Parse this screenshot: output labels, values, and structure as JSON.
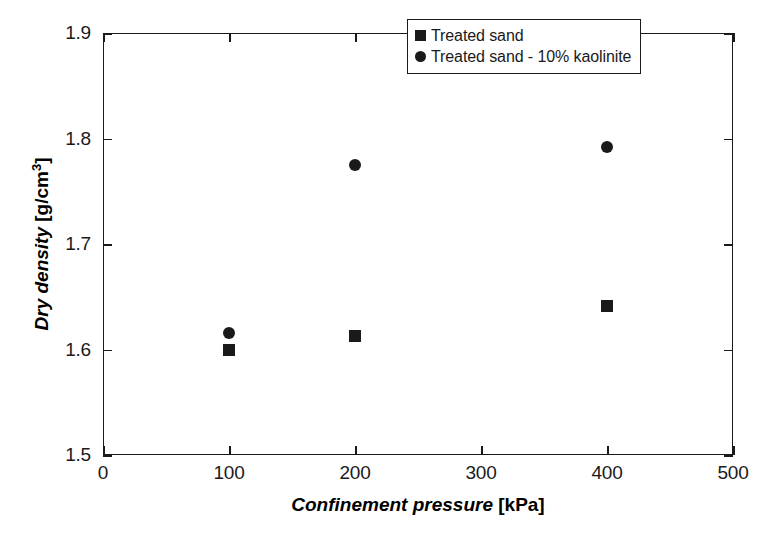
{
  "chart_data": {
    "type": "scatter",
    "title": "",
    "xlabel_name": "Confinement pressure",
    "xlabel_units": "[kPa]",
    "ylabel_name": "Dry density",
    "ylabel_units_pre": "[g/cm",
    "ylabel_units_sup": "3",
    "ylabel_units_post": "]",
    "xlim": [
      0,
      500
    ],
    "ylim": [
      1.5,
      1.9
    ],
    "xticks": [
      0,
      100,
      200,
      300,
      400,
      500
    ],
    "xtick_labels": [
      "0",
      "100",
      "200",
      "300",
      "400",
      "500"
    ],
    "yticks": [
      1.5,
      1.6,
      1.7,
      1.8,
      1.9
    ],
    "ytick_labels": [
      "1.5",
      "1.6",
      "1.7",
      "1.8",
      "1.9"
    ],
    "grid": false,
    "legend_position": "top-right-inside",
    "marker_color": "#1a1a1a",
    "series": [
      {
        "name": "Treated sand",
        "marker": "square",
        "x": [
          100,
          200,
          400
        ],
        "values": [
          1.6,
          1.613,
          1.641
        ]
      },
      {
        "name": "Treated sand - 10% kaolinite",
        "marker": "circle",
        "x": [
          100,
          200,
          400
        ],
        "values": [
          1.616,
          1.775,
          1.792
        ]
      }
    ]
  },
  "legend": {
    "items": [
      {
        "label": "Treated sand",
        "marker": "square"
      },
      {
        "label": "Treated sand - 10% kaolinite",
        "marker": "circle"
      }
    ]
  }
}
